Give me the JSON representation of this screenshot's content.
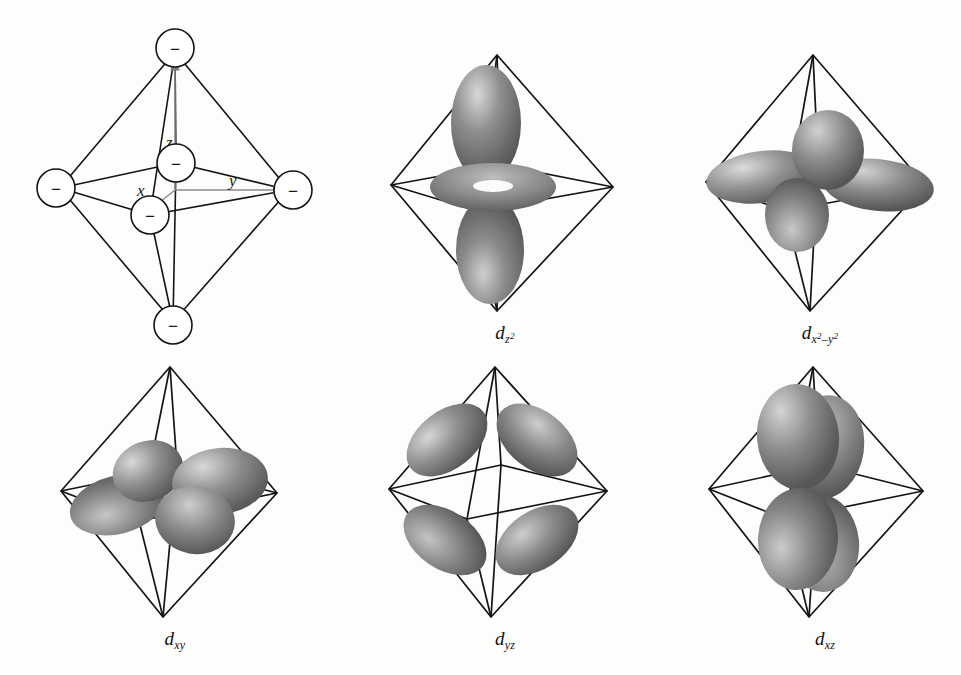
{
  "figure": {
    "background_color": "#fdfdfb",
    "line_color": "#141414",
    "orbital_fill_dark": "#6f6f6f",
    "orbital_fill_light": "#cfcfcf"
  },
  "panels": [
    {
      "id": "octahedron-axes",
      "caption": "",
      "kind": "octahedron-with-axes",
      "ligand_charge_symbol": "−",
      "ligand_count": 6,
      "axes": [
        {
          "name": "z",
          "label": "z",
          "direction": "up"
        },
        {
          "name": "y",
          "label": "y",
          "direction": "right"
        },
        {
          "name": "x",
          "label": "x",
          "direction": "toward-viewer-lower-left"
        }
      ]
    },
    {
      "id": "dz2",
      "kind": "orbital",
      "caption_plain": "dz2",
      "caption": {
        "d": "d",
        "sub": "z",
        "sup": "2"
      },
      "lobes": "two axial lobes along z plus equatorial torus"
    },
    {
      "id": "dx2-y2",
      "kind": "orbital",
      "caption_plain": "dx2-y2",
      "caption": {
        "d": "d",
        "sub1": "x",
        "sup1": "2",
        "op": "–",
        "sub2": "y",
        "sup2": "2"
      },
      "lobes": "four lobes along x and y axes"
    },
    {
      "id": "dxy",
      "kind": "orbital",
      "caption_plain": "dxy",
      "caption": {
        "d": "d",
        "sub": "xy"
      },
      "lobes": "four lobes between x and y axes"
    },
    {
      "id": "dyz",
      "kind": "orbital",
      "caption_plain": "dyz",
      "caption": {
        "d": "d",
        "sub": "yz"
      },
      "lobes": "four lobes between y and z axes"
    },
    {
      "id": "dxz",
      "kind": "orbital",
      "caption_plain": "dxz",
      "caption": {
        "d": "d",
        "sub": "xz"
      },
      "lobes": "four lobes between x and z axes"
    }
  ],
  "captions": {
    "dz2": {
      "base": "d",
      "sub": "z",
      "sup": "2"
    },
    "dx2y2": {
      "base": "d",
      "sub1": "x",
      "sup1": "2",
      "minus": "–",
      "sub2": "y",
      "sup2": "2"
    },
    "dxy": {
      "base": "d",
      "sub": "xy"
    },
    "dyz": {
      "base": "d",
      "sub": "yz"
    },
    "dxz": {
      "base": "d",
      "sub": "xz"
    }
  }
}
